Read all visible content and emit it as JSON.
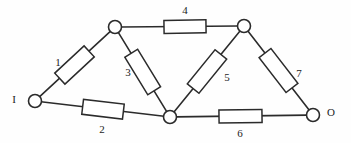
{
  "figure": {
    "type": "circuit-diagram",
    "title": "",
    "background_color": "#fefefe",
    "line_color": "#2b2b2b",
    "width": 351,
    "height": 143
  },
  "terminals": [
    {
      "id": "input",
      "label": "I",
      "node": "n1",
      "label_x": 14,
      "label_y": 100
    },
    {
      "id": "output",
      "label": "O",
      "node": "n5",
      "label_x": 331,
      "label_y": 113
    }
  ],
  "nodes": [
    {
      "id": "n1",
      "name": "input-node",
      "x": 35,
      "y": 101,
      "r": 6.5
    },
    {
      "id": "n2",
      "name": "top-left-node",
      "x": 115,
      "y": 27,
      "r": 6.5
    },
    {
      "id": "n3",
      "name": "bottom-center-node",
      "x": 170,
      "y": 117,
      "r": 6.5
    },
    {
      "id": "n4",
      "name": "top-right-node",
      "x": 244,
      "y": 26,
      "r": 6.5
    },
    {
      "id": "n5",
      "name": "output-node",
      "x": 313,
      "y": 115,
      "r": 6.5
    }
  ],
  "components": [
    {
      "id": "r1",
      "label": "1",
      "from": "n1",
      "to": "n2",
      "label_x": 58,
      "label_y": 63,
      "body_center_x": 74.5,
      "body_center_y": 65.0,
      "body_length": 40,
      "body_width": 15,
      "angle_deg": -42.8
    },
    {
      "id": "r2",
      "label": "2",
      "from": "n1",
      "to": "n3",
      "label_x": 102,
      "label_y": 130,
      "body_center_x": 103,
      "body_center_y": 109.2,
      "body_length": 41,
      "body_width": 15,
      "angle_deg": 6.8
    },
    {
      "id": "r3",
      "label": "3",
      "from": "n2",
      "to": "n3",
      "label_x": 128,
      "label_y": 73,
      "body_center_x": 142.7,
      "body_center_y": 72.0,
      "body_length": 44,
      "body_width": 15,
      "angle_deg": 58.6
    },
    {
      "id": "r4",
      "label": "4",
      "from": "n2",
      "to": "n4",
      "label_x": 185,
      "label_y": 11,
      "body_center_x": 185,
      "body_center_y": 26.6,
      "body_length": 42,
      "body_width": 13,
      "angle_deg": -0.8
    },
    {
      "id": "r5",
      "label": "5",
      "from": "n3",
      "to": "n4",
      "label_x": 227,
      "label_y": 78,
      "body_center_x": 207,
      "body_center_y": 71.5,
      "body_length": 44,
      "body_width": 15,
      "angle_deg": -50.9
    },
    {
      "id": "r6",
      "label": "6",
      "from": "n3",
      "to": "n5",
      "label_x": 240,
      "label_y": 134,
      "body_center_x": 240.5,
      "body_center_y": 116.3,
      "body_length": 43,
      "body_width": 13,
      "angle_deg": -0.8
    },
    {
      "id": "r7",
      "label": "7",
      "from": "n4",
      "to": "n5",
      "label_x": 299,
      "label_y": 74,
      "body_center_x": 278.5,
      "body_center_y": 70.5,
      "body_length": 44,
      "body_width": 15,
      "angle_deg": 52.2
    }
  ]
}
